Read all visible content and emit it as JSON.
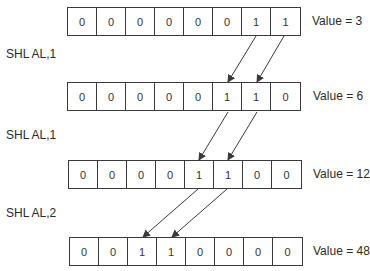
{
  "diagram": {
    "title": "",
    "rows": [
      {
        "bits": [
          "0",
          "0",
          "0",
          "0",
          "0",
          "0",
          "1",
          "1"
        ],
        "value_label": "Value = 3"
      },
      {
        "bits": [
          "0",
          "0",
          "0",
          "0",
          "0",
          "1",
          "1",
          "0"
        ],
        "value_label": "Value = 6"
      },
      {
        "bits": [
          "0",
          "0",
          "0",
          "0",
          "1",
          "1",
          "0",
          "0"
        ],
        "value_label": "Value = 12"
      },
      {
        "bits": [
          "0",
          "0",
          "1",
          "1",
          "0",
          "0",
          "0",
          "0"
        ],
        "value_label": "Value = 48"
      }
    ],
    "operations": [
      {
        "label": "SHL AL,1"
      },
      {
        "label": "SHL AL,1"
      },
      {
        "label": "SHL AL,2"
      }
    ],
    "colors": {
      "line": "#3a3a3a",
      "text": "#2a2a2a",
      "background": "#ffffff"
    }
  }
}
